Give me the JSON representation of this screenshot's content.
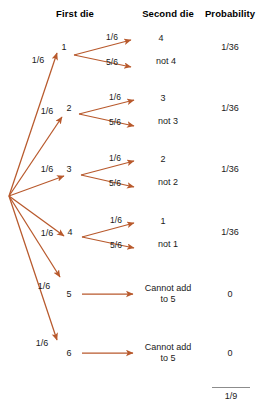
{
  "headers": {
    "first_die": "First die",
    "second_die": "Second die",
    "probability": "Probability"
  },
  "colors": {
    "arrow": "#b8592c",
    "text": "#1a1a1a",
    "header_text": "#000000",
    "rule": "#8c8c8c",
    "background": "#ffffff"
  },
  "branches": [
    {
      "first_die": "1",
      "first_prob": "1/6",
      "second": [
        {
          "prob": "1/6",
          "outcome": "4"
        },
        {
          "prob": "5/6",
          "outcome": "not 4"
        }
      ],
      "probability": "1/36"
    },
    {
      "first_die": "2",
      "first_prob": "1/6",
      "second": [
        {
          "prob": "1/6",
          "outcome": "3"
        },
        {
          "prob": "5/6",
          "outcome": "not 3"
        }
      ],
      "probability": "1/36"
    },
    {
      "first_die": "3",
      "first_prob": "1/6",
      "second": [
        {
          "prob": "1/6",
          "outcome": "2"
        },
        {
          "prob": "5/6",
          "outcome": "not 2"
        }
      ],
      "probability": "1/36"
    },
    {
      "first_die": "4",
      "first_prob": "1/6",
      "second": [
        {
          "prob": "1/6",
          "outcome": "1"
        },
        {
          "prob": "5/6",
          "outcome": "not 1"
        }
      ],
      "probability": "1/36"
    },
    {
      "first_die": "5",
      "first_prob": "1/6",
      "second": [
        {
          "prob": "",
          "outcome": "Cannot add to 5"
        }
      ],
      "probability": "0"
    },
    {
      "first_die": "6",
      "first_prob": "1/6",
      "second": [
        {
          "prob": "",
          "outcome": "Cannot add to 5"
        }
      ],
      "probability": "0"
    }
  ],
  "total": "1/9"
}
